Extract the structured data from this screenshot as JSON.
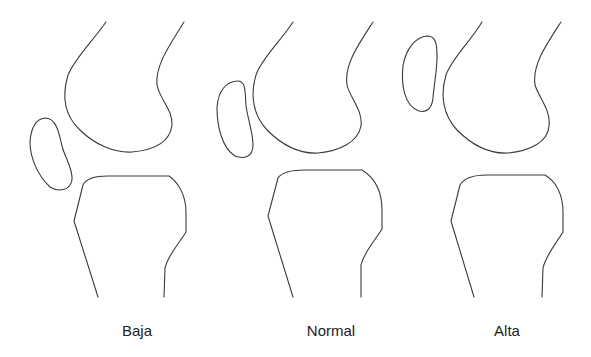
{
  "figure": {
    "panels": [
      {
        "id": "baja",
        "label": "Baja",
        "patella_position": "low"
      },
      {
        "id": "normal",
        "label": "Normal",
        "patella_position": "normal"
      },
      {
        "id": "alta",
        "label": "Alta",
        "patella_position": "high"
      }
    ],
    "colors": {
      "stroke": "#3a3a3a",
      "background": "#ffffff",
      "text": "#222222"
    }
  }
}
